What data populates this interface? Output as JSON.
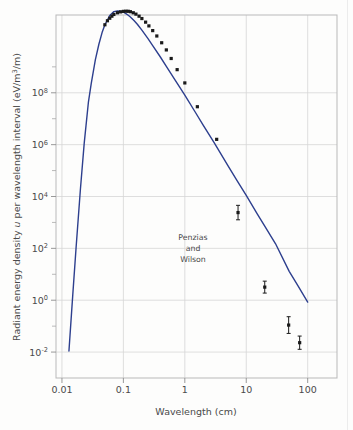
{
  "figure": {
    "name": "cmb-blackbody-spectrum",
    "background_color": "#fdfdfc",
    "curve_color": "#2d3f8e",
    "point_color": "#1a1a1a",
    "grid_color": "#d6d6d6",
    "frame_color": "#b9b9b9"
  },
  "chart_data": {
    "type": "line",
    "title": "",
    "subtitle": "",
    "xlabel": "Wavelength (cm)",
    "ylabel": "Radiant energy density u per wavelength interval (eV/m3/m)",
    "ylabel_parts": {
      "lead": "Radiant energy density ",
      "symbol": "u",
      "mid": " per wavelength interval (eV/m",
      "exp": "3",
      "tail": "/m)"
    },
    "xscale": "log",
    "yscale": "log",
    "xlim": [
      0.008,
      300
    ],
    "ylim": [
      0.001,
      100000000000.0
    ],
    "grid": true,
    "legend": "none",
    "xticks": [
      {
        "value": 0.01,
        "label": "0.01"
      },
      {
        "value": 0.1,
        "label": "0.1"
      },
      {
        "value": 1,
        "label": "1"
      },
      {
        "value": 10,
        "label": "10"
      },
      {
        "value": 100,
        "label": "100"
      }
    ],
    "yticks": [
      {
        "value": 100000000.0,
        "mantissa": "10",
        "exponent": "8"
      },
      {
        "value": 1000000.0,
        "mantissa": "10",
        "exponent": "6"
      },
      {
        "value": 10000.0,
        "mantissa": "10",
        "exponent": "4"
      },
      {
        "value": 100.0,
        "mantissa": "10",
        "exponent": "2"
      },
      {
        "value": 1,
        "mantissa": "10",
        "exponent": "0"
      },
      {
        "value": 0.01,
        "mantissa": "10",
        "exponent": "-2"
      }
    ],
    "yminorticks": [
      1000000000.0,
      10000000.0,
      100000.0,
      1000.0,
      10,
      0.1
    ],
    "series": [
      {
        "name": "Planck blackbody curve (T = 2.7 K)",
        "type": "line",
        "color": "#2d3f8e",
        "x": [
          0.013,
          0.015,
          0.017,
          0.02,
          0.023,
          0.027,
          0.03,
          0.035,
          0.04,
          0.045,
          0.05,
          0.06,
          0.07,
          0.08,
          0.09,
          0.1,
          0.11,
          0.12,
          0.13,
          0.15,
          0.17,
          0.2,
          0.25,
          0.3,
          0.4,
          0.5,
          0.7,
          1.0,
          1.5,
          2.0,
          3.0,
          5.0,
          7.0,
          10.0,
          15.0,
          20.0,
          30.0,
          50.0,
          70.0,
          100.0
        ],
        "y": [
          0.011,
          1.6,
          110,
          20000.0,
          1100000.0,
          45000000.0,
          230000000.0,
          1900000000.0,
          7600000000.0,
          21000000000.0,
          42000000000.0,
          96000000000.0,
          135000000000.0,
          145000000000.0,
          140000000000.0,
          128000000000.0,
          113000000000.0,
          98000000000.0,
          84000000000.0,
          60000000000.0,
          43000000000.0,
          26000000000.0,
          12500000000.0,
          6600000000.0,
          2400000000.0,
          1050000000.0,
          300000000.0,
          82000000.0,
          17000000.0,
          5500000.0,
          1200000.0,
          160000.0,
          43000.0,
          11000.0,
          2200.0,
          720.0,
          150.0,
          13.0,
          3.5,
          0.85
        ]
      },
      {
        "name": "Measured data points",
        "type": "scatter",
        "color": "#1a1a1a",
        "marker": "square",
        "points": [
          {
            "x": 0.05,
            "y": 42000000000.0
          },
          {
            "x": 0.055,
            "y": 60000000000.0
          },
          {
            "x": 0.06,
            "y": 75000000000.0
          },
          {
            "x": 0.065,
            "y": 90000000000.0
          },
          {
            "x": 0.07,
            "y": 105000000000.0
          },
          {
            "x": 0.08,
            "y": 122000000000.0
          },
          {
            "x": 0.09,
            "y": 132000000000.0
          },
          {
            "x": 0.1,
            "y": 138000000000.0
          },
          {
            "x": 0.11,
            "y": 140000000000.0
          },
          {
            "x": 0.12,
            "y": 139000000000.0
          },
          {
            "x": 0.13,
            "y": 134000000000.0
          },
          {
            "x": 0.145,
            "y": 122000000000.0
          },
          {
            "x": 0.16,
            "y": 108000000000.0
          },
          {
            "x": 0.18,
            "y": 90000000000.0
          },
          {
            "x": 0.2,
            "y": 73000000000.0
          },
          {
            "x": 0.23,
            "y": 53000000000.0
          },
          {
            "x": 0.26,
            "y": 38000000000.0
          },
          {
            "x": 0.3,
            "y": 25000000000.0
          },
          {
            "x": 0.35,
            "y": 15500000000.0
          },
          {
            "x": 0.42,
            "y": 8500000000.0
          },
          {
            "x": 0.5,
            "y": 4500000000.0
          },
          {
            "x": 0.6,
            "y": 2100000000.0
          },
          {
            "x": 0.75,
            "y": 780000000.0
          },
          {
            "x": 1.0,
            "y": 240000000.0
          },
          {
            "x": 1.6,
            "y": 29000000.0
          },
          {
            "x": 3.3,
            "y": 1600000.0
          },
          {
            "x": 7.35,
            "y": 2400.0
          },
          {
            "x": 20.0,
            "y": 3.2
          },
          {
            "x": 49.0,
            "y": 0.11
          },
          {
            "x": 74.0,
            "y": 0.023
          }
        ],
        "error_bar_points": [
          {
            "x": 7.35,
            "y": 2400.0,
            "err_hi": 1.9,
            "err_lo": 1.9
          },
          {
            "x": 20.0,
            "y": 3.2,
            "err_hi": 1.7,
            "err_lo": 1.7
          },
          {
            "x": 49.0,
            "y": 0.11,
            "err_hi": 2.1,
            "err_lo": 2.1
          },
          {
            "x": 74.0,
            "y": 0.023,
            "err_hi": 1.8,
            "err_lo": 1.8
          }
        ]
      }
    ],
    "annotations": [
      {
        "name": "penzias-wilson-label",
        "lines": [
          "Penzias",
          "and",
          "Wilson"
        ],
        "target_x": 7.35,
        "target_y": 2400.0
      }
    ]
  }
}
